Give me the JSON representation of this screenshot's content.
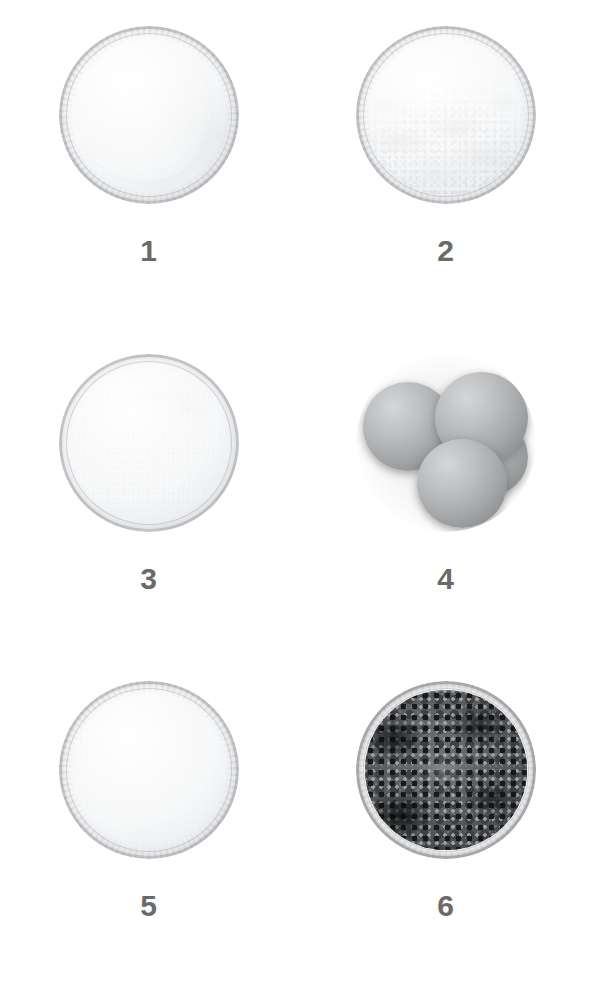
{
  "figure": {
    "background_color": "#ffffff",
    "label_color": "#6a6a6a",
    "width": 594,
    "height": 984,
    "columns": 2,
    "rows": 3
  },
  "samples": [
    {
      "label": "1",
      "appearance": "white disc-shaped tablet in clear glass dish",
      "material_tone": "#fdfdfd",
      "container": "glass dish"
    },
    {
      "label": "2",
      "appearance": "coarse white-gray granular powder in clear glass dish",
      "material_tone": "#b9bcbf",
      "container": "glass dish"
    },
    {
      "label": "3",
      "appearance": "fine white powder in clear glass dish",
      "material_tone": "#ffffff",
      "container": "glass dish"
    },
    {
      "label": "4",
      "appearance": "four gray spherical beads",
      "material_tone": "#a3a5a7",
      "container": "none"
    },
    {
      "label": "5",
      "appearance": "fine white crystalline powder in clear glass dish",
      "material_tone": "#fbfbfc",
      "container": "glass dish"
    },
    {
      "label": "6",
      "appearance": "dark gray-black coarse granules in clear glass dish",
      "material_tone": "#46484a",
      "container": "glass dish"
    }
  ]
}
